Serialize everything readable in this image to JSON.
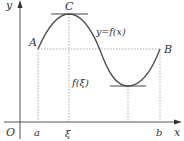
{
  "figure": {
    "colors": {
      "curve": "#4a4a4a",
      "axis": "#555555",
      "dashed": "#999999",
      "text": "#333333"
    },
    "axes": {
      "x_label": "x",
      "y_label": "y",
      "origin_label": "O"
    },
    "x_ticks": [
      {
        "label": "a",
        "x": 38
      },
      {
        "label": "ξ",
        "x": 69
      },
      {
        "label": "b",
        "x": 160
      }
    ],
    "points": [
      {
        "label": "A",
        "x": 38,
        "y": 49
      },
      {
        "label": "C",
        "x": 69,
        "y": 14
      },
      {
        "label": "B",
        "x": 160,
        "y": 49
      }
    ],
    "curve_label": "y=f(x)",
    "value_label": "f(ξ)"
  }
}
